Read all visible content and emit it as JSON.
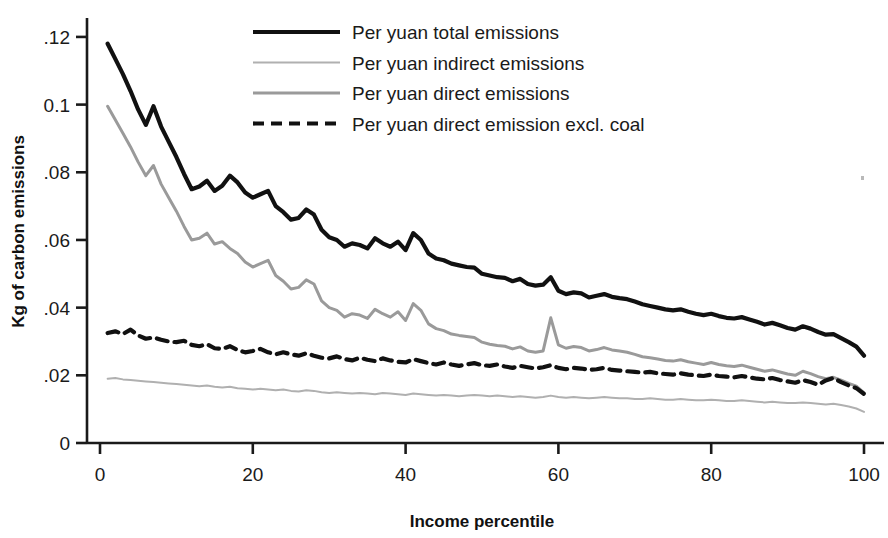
{
  "figure": {
    "background": "#ffffff",
    "speck_color": "#b9b9b9"
  },
  "axes": {
    "y_title": "Kg of carbon emissions",
    "x_title": "Income percentile",
    "y_ticks": [
      "0",
      ".02",
      ".04",
      ".06",
      ".08",
      "0.1",
      ".12"
    ],
    "x_ticks": [
      "0",
      "20",
      "40",
      "60",
      "80",
      "100"
    ],
    "axis_color": "#1a1a1a"
  },
  "legend": {
    "items": [
      {
        "label": "Per yuan total emissions",
        "style": "solid",
        "color": "#111111",
        "width": 4.2
      },
      {
        "label": "Per yuan indirect emissions",
        "style": "solid",
        "color": "#b0b0b0",
        "width": 2.0
      },
      {
        "label": "Per yuan direct emissions",
        "style": "solid",
        "color": "#9a9a9a",
        "width": 3.0
      },
      {
        "label": "Per yuan direct emission excl. coal",
        "style": "dashed",
        "color": "#111111",
        "width": 4.2
      }
    ]
  },
  "chart_data": {
    "type": "line",
    "title": "",
    "xlabel": "Income percentile",
    "ylabel": "Kg of carbon emissions",
    "xlim": [
      0,
      100
    ],
    "ylim": [
      0,
      0.125
    ],
    "xticks": [
      0,
      20,
      40,
      60,
      80,
      100
    ],
    "yticks": [
      0,
      0.02,
      0.04,
      0.06,
      0.08,
      0.1,
      0.12
    ],
    "grid": false,
    "legend_position": "top-right",
    "x": [
      1,
      2,
      3,
      4,
      5,
      6,
      7,
      8,
      9,
      10,
      11,
      12,
      13,
      14,
      15,
      16,
      17,
      18,
      19,
      20,
      21,
      22,
      23,
      24,
      25,
      26,
      27,
      28,
      29,
      30,
      31,
      32,
      33,
      34,
      35,
      36,
      37,
      38,
      39,
      40,
      41,
      42,
      43,
      44,
      45,
      46,
      47,
      48,
      49,
      50,
      51,
      52,
      53,
      54,
      55,
      56,
      57,
      58,
      59,
      60,
      61,
      62,
      63,
      64,
      65,
      66,
      67,
      68,
      69,
      70,
      71,
      72,
      73,
      74,
      75,
      76,
      77,
      78,
      79,
      80,
      81,
      82,
      83,
      84,
      85,
      86,
      87,
      88,
      89,
      90,
      91,
      92,
      93,
      94,
      95,
      96,
      97,
      98,
      99,
      100
    ],
    "series": [
      {
        "name": "Per yuan total emissions",
        "color": "#111111",
        "style": "solid",
        "values": [
          0.118,
          0.1135,
          0.109,
          0.104,
          0.0985,
          0.094,
          0.0995,
          0.0935,
          0.089,
          0.0845,
          0.0795,
          0.075,
          0.0758,
          0.0775,
          0.0745,
          0.076,
          0.079,
          0.077,
          0.074,
          0.0725,
          0.0735,
          0.0745,
          0.07,
          0.0682,
          0.066,
          0.0665,
          0.069,
          0.0675,
          0.063,
          0.0608,
          0.06,
          0.058,
          0.059,
          0.0585,
          0.0575,
          0.0605,
          0.059,
          0.058,
          0.0595,
          0.057,
          0.062,
          0.06,
          0.056,
          0.0545,
          0.054,
          0.053,
          0.0525,
          0.052,
          0.0518,
          0.05,
          0.0495,
          0.049,
          0.0488,
          0.0478,
          0.0485,
          0.047,
          0.0465,
          0.0468,
          0.049,
          0.045,
          0.044,
          0.0445,
          0.0442,
          0.043,
          0.0435,
          0.044,
          0.0432,
          0.0428,
          0.0425,
          0.0418,
          0.041,
          0.0405,
          0.04,
          0.0395,
          0.0392,
          0.0395,
          0.0388,
          0.0382,
          0.0378,
          0.0382,
          0.0375,
          0.037,
          0.0368,
          0.0372,
          0.0365,
          0.0358,
          0.035,
          0.0355,
          0.0348,
          0.034,
          0.0335,
          0.0345,
          0.0338,
          0.0328,
          0.032,
          0.0322,
          0.031,
          0.0298,
          0.0285,
          0.0258
        ]
      },
      {
        "name": "Per yuan direct emissions",
        "color": "#9a9a9a",
        "style": "solid",
        "values": [
          0.0995,
          0.0955,
          0.0915,
          0.0875,
          0.083,
          0.079,
          0.082,
          0.0765,
          0.0725,
          0.0685,
          0.064,
          0.06,
          0.0605,
          0.062,
          0.0588,
          0.0595,
          0.0575,
          0.056,
          0.0535,
          0.052,
          0.053,
          0.054,
          0.0495,
          0.0478,
          0.0455,
          0.046,
          0.0482,
          0.047,
          0.042,
          0.04,
          0.0392,
          0.0372,
          0.0382,
          0.0378,
          0.0368,
          0.0395,
          0.0382,
          0.0372,
          0.0388,
          0.0362,
          0.0412,
          0.0392,
          0.0352,
          0.0338,
          0.0332,
          0.0322,
          0.0318,
          0.0315,
          0.0312,
          0.0298,
          0.0292,
          0.0288,
          0.0286,
          0.0278,
          0.0284,
          0.0272,
          0.0268,
          0.0272,
          0.037,
          0.029,
          0.028,
          0.0285,
          0.0282,
          0.0272,
          0.0276,
          0.0282,
          0.0275,
          0.0272,
          0.0268,
          0.0262,
          0.0255,
          0.0252,
          0.0248,
          0.0244,
          0.0242,
          0.0246,
          0.024,
          0.0236,
          0.0232,
          0.0238,
          0.0232,
          0.0228,
          0.0226,
          0.023,
          0.0224,
          0.0218,
          0.0212,
          0.0216,
          0.021,
          0.0204,
          0.02,
          0.0212,
          0.0205,
          0.0196,
          0.019,
          0.0194,
          0.0186,
          0.0176,
          0.0168,
          0.0148
        ]
      },
      {
        "name": "Per yuan direct emission excl. coal",
        "color": "#111111",
        "style": "dashed",
        "values": [
          0.0325,
          0.033,
          0.0322,
          0.0335,
          0.0318,
          0.0308,
          0.0312,
          0.0305,
          0.03,
          0.0298,
          0.0302,
          0.029,
          0.0286,
          0.0292,
          0.028,
          0.0278,
          0.0286,
          0.0275,
          0.0268,
          0.0272,
          0.0278,
          0.0268,
          0.0262,
          0.0268,
          0.0262,
          0.0258,
          0.0265,
          0.0258,
          0.0252,
          0.025,
          0.0256,
          0.0248,
          0.0244,
          0.0252,
          0.0246,
          0.0242,
          0.025,
          0.0244,
          0.024,
          0.0238,
          0.0248,
          0.0242,
          0.0236,
          0.0232,
          0.0238,
          0.0232,
          0.0228,
          0.0232,
          0.0236,
          0.023,
          0.0228,
          0.0232,
          0.0226,
          0.0222,
          0.0228,
          0.0224,
          0.022,
          0.0224,
          0.023,
          0.0222,
          0.0218,
          0.0222,
          0.022,
          0.0216,
          0.0218,
          0.0222,
          0.0216,
          0.0214,
          0.0212,
          0.021,
          0.0208,
          0.021,
          0.0206,
          0.0204,
          0.0202,
          0.0206,
          0.0202,
          0.02,
          0.0198,
          0.0202,
          0.0198,
          0.0196,
          0.0194,
          0.0198,
          0.0194,
          0.019,
          0.0188,
          0.0192,
          0.0186,
          0.0182,
          0.0178,
          0.0186,
          0.018,
          0.0172,
          0.0185,
          0.0192,
          0.018,
          0.017,
          0.0162,
          0.0145
        ]
      },
      {
        "name": "Per yuan indirect emissions",
        "color": "#b0b0b0",
        "style": "solid",
        "values": [
          0.019,
          0.0192,
          0.0188,
          0.0186,
          0.0184,
          0.0182,
          0.018,
          0.0178,
          0.0176,
          0.0174,
          0.0172,
          0.017,
          0.0168,
          0.017,
          0.0166,
          0.0164,
          0.0166,
          0.0162,
          0.016,
          0.0158,
          0.016,
          0.0158,
          0.0156,
          0.0158,
          0.0154,
          0.0152,
          0.0156,
          0.0154,
          0.015,
          0.0148,
          0.015,
          0.0148,
          0.0146,
          0.0148,
          0.0146,
          0.0144,
          0.0148,
          0.0146,
          0.0144,
          0.0142,
          0.0146,
          0.0144,
          0.0142,
          0.014,
          0.0142,
          0.014,
          0.0138,
          0.014,
          0.0142,
          0.014,
          0.0138,
          0.014,
          0.0138,
          0.0136,
          0.0138,
          0.0136,
          0.0134,
          0.0136,
          0.014,
          0.0136,
          0.0134,
          0.0136,
          0.0134,
          0.0132,
          0.0134,
          0.0136,
          0.0134,
          0.0132,
          0.0132,
          0.013,
          0.013,
          0.0132,
          0.013,
          0.0128,
          0.0128,
          0.013,
          0.0128,
          0.0126,
          0.0126,
          0.0128,
          0.0126,
          0.0124,
          0.0124,
          0.0126,
          0.0124,
          0.0122,
          0.012,
          0.0122,
          0.012,
          0.0118,
          0.0118,
          0.012,
          0.0118,
          0.0116,
          0.0114,
          0.0116,
          0.0112,
          0.0108,
          0.0102,
          0.0092
        ]
      }
    ]
  }
}
